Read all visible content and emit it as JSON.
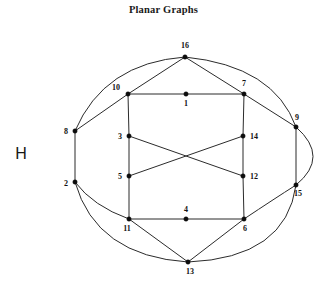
{
  "figure": {
    "title": "Planar Graphs",
    "graph_name": "H",
    "background_color": "#ffffff",
    "stroke_color": "#2b2b2b",
    "node_color": "#0d0d0d",
    "label_color": "#111111"
  },
  "graph": {
    "node_count": 16,
    "edge_count": 24,
    "nodes": [
      {
        "id": "16",
        "label": "16",
        "x": 185,
        "y": 57,
        "label_x": 185,
        "label_y": 48,
        "label_anchor": "middle"
      },
      {
        "id": "10",
        "label": "10",
        "x": 128,
        "y": 94,
        "label_x": 120,
        "label_y": 90,
        "label_anchor": "end"
      },
      {
        "id": "1",
        "label": "1",
        "x": 186,
        "y": 94,
        "label_x": 186,
        "label_y": 106,
        "label_anchor": "middle"
      },
      {
        "id": "7",
        "label": "7",
        "x": 244,
        "y": 94,
        "label_x": 244,
        "label_y": 86,
        "label_anchor": "middle"
      },
      {
        "id": "9",
        "label": "9",
        "x": 296,
        "y": 127,
        "label_x": 297,
        "label_y": 120,
        "label_anchor": "middle"
      },
      {
        "id": "8",
        "label": "8",
        "x": 75,
        "y": 131,
        "label_x": 68,
        "label_y": 134,
        "label_anchor": "end"
      },
      {
        "id": "3",
        "label": "3",
        "x": 129,
        "y": 136,
        "label_x": 122,
        "label_y": 139,
        "label_anchor": "end"
      },
      {
        "id": "14",
        "label": "14",
        "x": 243,
        "y": 136,
        "label_x": 250,
        "label_y": 139,
        "label_anchor": "start"
      },
      {
        "id": "5",
        "label": "5",
        "x": 129,
        "y": 176,
        "label_x": 122,
        "label_y": 179,
        "label_anchor": "end"
      },
      {
        "id": "12",
        "label": "12",
        "x": 243,
        "y": 176,
        "label_x": 250,
        "label_y": 179,
        "label_anchor": "start"
      },
      {
        "id": "2",
        "label": "2",
        "x": 75,
        "y": 182,
        "label_x": 68,
        "label_y": 186,
        "label_anchor": "end"
      },
      {
        "id": "15",
        "label": "15",
        "x": 296,
        "y": 185,
        "label_x": 298,
        "label_y": 196,
        "label_anchor": "middle"
      },
      {
        "id": "11",
        "label": "11",
        "x": 129,
        "y": 219,
        "label_x": 127,
        "label_y": 231,
        "label_anchor": "middle"
      },
      {
        "id": "4",
        "label": "4",
        "x": 186,
        "y": 219,
        "label_x": 186,
        "label_y": 212,
        "label_anchor": "middle"
      },
      {
        "id": "6",
        "label": "6",
        "x": 244,
        "y": 219,
        "label_x": 245,
        "label_y": 231,
        "label_anchor": "middle"
      },
      {
        "id": "13",
        "label": "13",
        "x": 188,
        "y": 262,
        "label_x": 190,
        "label_y": 274,
        "label_anchor": "middle"
      }
    ],
    "straight_edges": [
      {
        "from": "10",
        "to": "1"
      },
      {
        "from": "1",
        "to": "7"
      },
      {
        "from": "10",
        "to": "3"
      },
      {
        "from": "3",
        "to": "5"
      },
      {
        "from": "5",
        "to": "11"
      },
      {
        "from": "7",
        "to": "14"
      },
      {
        "from": "14",
        "to": "12"
      },
      {
        "from": "12",
        "to": "6"
      },
      {
        "from": "11",
        "to": "4"
      },
      {
        "from": "4",
        "to": "6"
      },
      {
        "from": "16",
        "to": "10"
      },
      {
        "from": "16",
        "to": "7"
      },
      {
        "from": "8",
        "to": "10"
      },
      {
        "from": "8",
        "to": "2"
      },
      {
        "from": "7",
        "to": "9"
      },
      {
        "from": "9",
        "to": "15"
      },
      {
        "from": "3",
        "to": "12"
      },
      {
        "from": "5",
        "to": "14"
      },
      {
        "from": "11",
        "to": "13"
      },
      {
        "from": "13",
        "to": "6"
      }
    ],
    "curved_edges": [
      {
        "from": "8",
        "to": "16",
        "path": "M 75 131 Q 104 63 185 57"
      },
      {
        "from": "16",
        "to": "9",
        "path": "M 185 57 Q 274 66 296 127"
      },
      {
        "from": "9",
        "to": "15",
        "path": "M 296 127 Q 330 157 296 185"
      },
      {
        "from": "2",
        "to": "11",
        "path": "M 75 182 Q 93 206 129 219"
      },
      {
        "from": "2",
        "to": "13",
        "path": "M 75 182 Q 96 256 188 262"
      },
      {
        "from": "13",
        "to": "15",
        "path": "M 188 262 Q 286 258 296 185"
      },
      {
        "from": "15",
        "to": "6",
        "path": "M 296 185 Q 274 199 244 219"
      }
    ]
  }
}
